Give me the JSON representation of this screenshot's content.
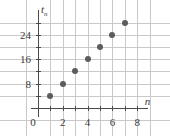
{
  "chart_data": {
    "type": "scatter",
    "title": "",
    "subtitle": "",
    "xlabel": "n",
    "ylabel": "t_n",
    "xlabel_display": "n",
    "ylabel_base": "t",
    "ylabel_sub": "n",
    "x": [
      1,
      2,
      3,
      4,
      5,
      6,
      7
    ],
    "values": [
      4,
      8,
      12,
      16,
      20,
      24,
      28
    ],
    "points": [
      {
        "n": 1,
        "t": 4
      },
      {
        "n": 2,
        "t": 8
      },
      {
        "n": 3,
        "t": 12
      },
      {
        "n": 4,
        "t": 16
      },
      {
        "n": 5,
        "t": 20
      },
      {
        "n": 6,
        "t": 24
      },
      {
        "n": 7,
        "t": 28
      }
    ],
    "xlim": [
      -1,
      9
    ],
    "ylim": [
      -4,
      32
    ],
    "x_tick_labels": [
      "0",
      "2",
      "4",
      "6",
      "8"
    ],
    "x_tick_values": [
      0,
      2,
      4,
      6,
      8
    ],
    "x_minor_tick_values": [
      1,
      3,
      5,
      7
    ],
    "y_tick_labels": [
      "8",
      "16",
      "24"
    ],
    "y_tick_values": [
      8,
      16,
      24
    ],
    "y_minor_tick_values": [
      4,
      12,
      20,
      28
    ],
    "grid": true,
    "grid_x_values": [
      -1,
      1,
      3,
      5,
      7,
      9
    ],
    "grid_y_values": [
      -4,
      4,
      12,
      20,
      28
    ],
    "legend": null,
    "legend_position": "none",
    "origin_label": "0",
    "marker_color": "#5c5c5c",
    "grid_color": "#c9c9c9",
    "axis_color": "#4a4a4a",
    "background_color": "#ffffff"
  }
}
